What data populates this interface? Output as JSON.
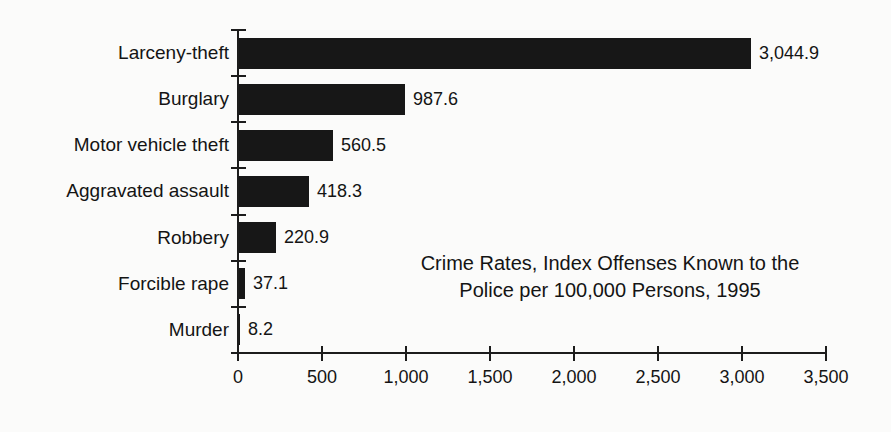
{
  "chart_data": {
    "type": "bar",
    "orientation": "horizontal",
    "title": "Crime Rates, Index Offenses Known to the Police per 100,000 Persons, 1995",
    "title_lines": [
      "Crime Rates, Index Offenses Known to the",
      "Police per 100,000 Persons, 1995"
    ],
    "categories": [
      "Larceny-theft",
      "Burglary",
      "Motor vehicle theft",
      "Aggravated assault",
      "Robbery",
      "Forcible rape",
      "Murder"
    ],
    "values": [
      3044.9,
      987.6,
      560.5,
      418.3,
      220.9,
      37.1,
      8.2
    ],
    "value_labels": [
      "3,044.9",
      "987.6",
      "560.5",
      "418.3",
      "220.9",
      "37.1",
      "8.2"
    ],
    "xlabel": "",
    "ylabel": "",
    "xlim": [
      0,
      3500
    ],
    "x_ticks": [
      0,
      500,
      1000,
      1500,
      2000,
      2500,
      3000,
      3500
    ],
    "x_tick_labels": [
      "0",
      "500",
      "1,000",
      "1,500",
      "2,000",
      "2,500",
      "3,000",
      "3,500"
    ],
    "grid": false,
    "legend": "none",
    "bar_color": "#171717",
    "background_color": "#fbfbfa",
    "text_color": "#141414"
  }
}
